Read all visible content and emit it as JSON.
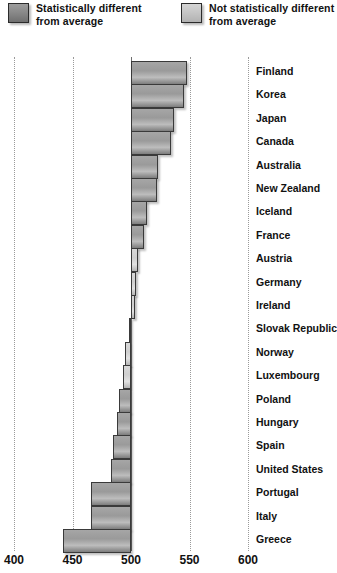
{
  "legend": {
    "items": [
      {
        "label_line1": "Statistically different",
        "label_line2": "from average",
        "swatch": "dark-gray-swatch",
        "color": "#8a8a8a"
      },
      {
        "label_line1": "Not statistically different",
        "label_line2": "from average",
        "swatch": "light-gray-swatch",
        "color": "#c6c6c6"
      }
    ]
  },
  "axis": {
    "ticks": [
      "400",
      "450",
      "500",
      "550",
      "600"
    ],
    "tick_values": [
      400,
      450,
      500,
      550,
      600
    ]
  },
  "chart_data": {
    "type": "bar",
    "orientation": "horizontal",
    "title": "",
    "xlabel": "",
    "ylabel": "",
    "xlim": [
      400,
      600
    ],
    "baseline": 500,
    "grid": true,
    "legend_position": "top",
    "categories": [
      "Finland",
      "Korea",
      "Japan",
      "Canada",
      "Australia",
      "New Zealand",
      "Iceland",
      "France",
      "Austria",
      "Germany",
      "Ireland",
      "Slovak Republic",
      "Norway",
      "Luxembourg",
      "Poland",
      "Hungary",
      "Spain",
      "United States",
      "Portugal",
      "Italy",
      "Greece"
    ],
    "values": [
      548,
      545,
      537,
      534,
      523,
      522,
      514,
      511,
      506,
      504,
      503,
      498,
      495,
      493,
      490,
      488,
      485,
      483,
      466,
      466,
      442
    ],
    "significance": [
      "significant",
      "significant",
      "significant",
      "significant",
      "significant",
      "significant",
      "significant",
      "significant",
      "not-significant",
      "not-significant",
      "not-significant",
      "not-significant",
      "not-significant",
      "not-significant",
      "significant",
      "significant",
      "significant",
      "significant",
      "significant",
      "significant",
      "significant"
    ]
  }
}
